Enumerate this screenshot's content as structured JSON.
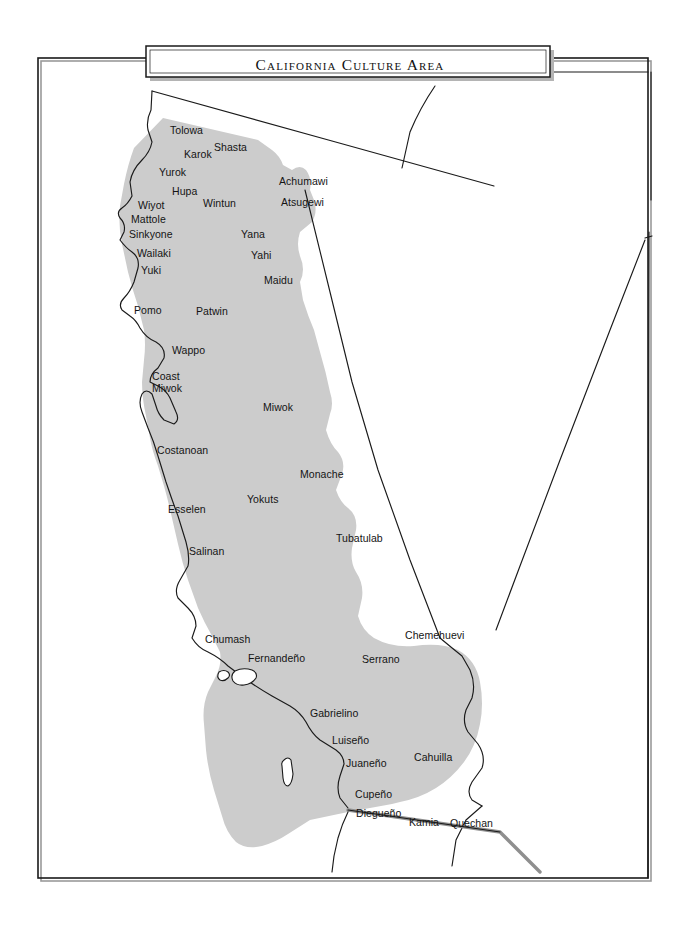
{
  "map": {
    "title": "California Culture Area",
    "colors": {
      "culture_area_fill": "#cccccc",
      "line": "#1a1a1a",
      "background": "#ffffff",
      "border_river": "#8f8f8f"
    },
    "labels": [
      {
        "name": "Tolowa",
        "text": "Tolowa",
        "x": 170,
        "y": 125
      },
      {
        "name": "Karok",
        "text": "Karok",
        "x": 184,
        "y": 149
      },
      {
        "name": "Shasta",
        "text": "Shasta",
        "x": 214,
        "y": 142
      },
      {
        "name": "Yurok",
        "text": "Yurok",
        "x": 159,
        "y": 167
      },
      {
        "name": "Hupa",
        "text": "Hupa",
        "x": 172,
        "y": 186
      },
      {
        "name": "Achumawi",
        "text": "Achumawi",
        "x": 279,
        "y": 176
      },
      {
        "name": "Wiyot",
        "text": "Wiyot",
        "x": 138,
        "y": 200
      },
      {
        "name": "Wintun",
        "text": "Wintun",
        "x": 203,
        "y": 198
      },
      {
        "name": "Atsugewi",
        "text": "Atsugewi",
        "x": 281,
        "y": 197
      },
      {
        "name": "Mattole",
        "text": "Mattole",
        "x": 131,
        "y": 214
      },
      {
        "name": "Sinkyone",
        "text": "Sinkyone",
        "x": 129,
        "y": 229
      },
      {
        "name": "Yana",
        "text": "Yana",
        "x": 241,
        "y": 229
      },
      {
        "name": "Wailaki",
        "text": "Wailaki",
        "x": 137,
        "y": 248
      },
      {
        "name": "Yahi",
        "text": "Yahi",
        "x": 251,
        "y": 250
      },
      {
        "name": "Yuki",
        "text": "Yuki",
        "x": 141,
        "y": 265
      },
      {
        "name": "Maidu",
        "text": "Maidu",
        "x": 264,
        "y": 275
      },
      {
        "name": "Pomo",
        "text": "Pomo",
        "x": 134,
        "y": 305
      },
      {
        "name": "Patwin",
        "text": "Patwin",
        "x": 196,
        "y": 306
      },
      {
        "name": "Wappo",
        "text": "Wappo",
        "x": 172,
        "y": 345
      },
      {
        "name": "CoastMiwok",
        "text": "Coast\nMiwok",
        "x": 152,
        "y": 371
      },
      {
        "name": "Miwok",
        "text": "Miwok",
        "x": 263,
        "y": 402
      },
      {
        "name": "Costanoan",
        "text": "Costanoan",
        "x": 157,
        "y": 445
      },
      {
        "name": "Monache",
        "text": "Monache",
        "x": 300,
        "y": 469
      },
      {
        "name": "Yokuts",
        "text": "Yokuts",
        "x": 247,
        "y": 494
      },
      {
        "name": "Esselen",
        "text": "Esselen",
        "x": 168,
        "y": 504
      },
      {
        "name": "Tubatulab",
        "text": "Tubatulab",
        "x": 336,
        "y": 533
      },
      {
        "name": "Salinan",
        "text": "Salinan",
        "x": 189,
        "y": 546
      },
      {
        "name": "Chumash",
        "text": "Chumash",
        "x": 205,
        "y": 634
      },
      {
        "name": "Chemehuevi",
        "text": "Chemehuevi",
        "x": 405,
        "y": 630
      },
      {
        "name": "Fernandeno",
        "text": "Fernandeño",
        "x": 248,
        "y": 653
      },
      {
        "name": "Serrano",
        "text": "Serrano",
        "x": 362,
        "y": 654
      },
      {
        "name": "Gabrielino",
        "text": "Gabrielino",
        "x": 310,
        "y": 708
      },
      {
        "name": "Luiseno",
        "text": "Luiseño",
        "x": 332,
        "y": 735
      },
      {
        "name": "Juaneno",
        "text": "Juaneño",
        "x": 346,
        "y": 758
      },
      {
        "name": "Cahuilla",
        "text": "Cahuilla",
        "x": 414,
        "y": 752
      },
      {
        "name": "Cupeno",
        "text": "Cupeño",
        "x": 355,
        "y": 789
      },
      {
        "name": "Diegueno",
        "text": "Diegueño",
        "x": 356,
        "y": 808
      },
      {
        "name": "Kamia",
        "text": "Kamia",
        "x": 409,
        "y": 817
      },
      {
        "name": "Quechan",
        "text": "Quechan",
        "x": 450,
        "y": 818
      }
    ]
  }
}
